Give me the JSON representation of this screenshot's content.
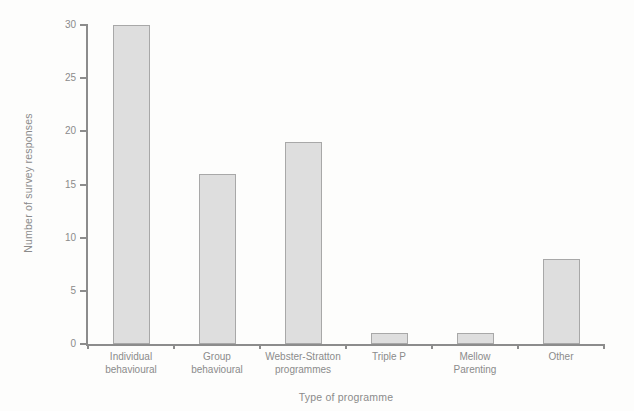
{
  "chart_data": {
    "type": "bar",
    "title": "",
    "categories": [
      "Individual behavioural",
      "Group behavioural",
      "Webster-Stratton programmes",
      "Triple P",
      "Mellow Parenting",
      "Other"
    ],
    "category_label_lines": [
      [
        "Individual",
        "behavioural"
      ],
      [
        "Group",
        "behavioural"
      ],
      [
        "Webster-Stratton",
        "programmes"
      ],
      [
        "Triple P"
      ],
      [
        "Mellow",
        "Parenting"
      ],
      [
        "Other"
      ]
    ],
    "values": [
      30,
      16,
      19,
      1,
      1,
      8
    ],
    "xlabel": "Type of programme",
    "ylabel": "Number of survey responses",
    "ylim": [
      0,
      30
    ],
    "yticks": [
      0,
      5,
      10,
      15,
      20,
      25,
      30
    ],
    "grid": false,
    "legend": null,
    "colors": {
      "bar_fill": "#dedede",
      "bar_border": "#a8a8a8",
      "axis": "#8c8c8c",
      "text": "#8b8b8b",
      "background": "#fdfdfc"
    }
  }
}
